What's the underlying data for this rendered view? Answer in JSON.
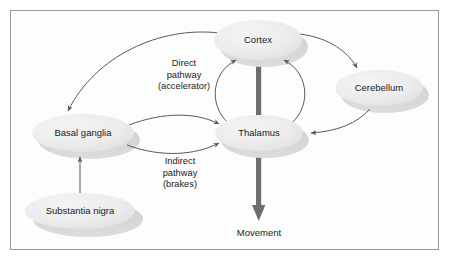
{
  "diagram": {
    "background_color": "#fdfdfd",
    "border_color": "#9a9a9a",
    "node_fill_color": "#ebebeb",
    "node_shadow_color": "#d2d2d2",
    "thin_arrow_color": "#5a5a5a",
    "thick_arrow_color": "#6e6e6e",
    "text_color": "#1c1c1c",
    "nodes": [
      {
        "id": "cortex",
        "label": "Cortex",
        "shape": "ellipse",
        "cx": 258,
        "cy": 40,
        "rx": 44,
        "ry": 20
      },
      {
        "id": "cerebellum",
        "label": "Cerebellum",
        "shape": "ellipse",
        "cx": 379,
        "cy": 88,
        "rx": 44,
        "ry": 18
      },
      {
        "id": "basal-ganglia",
        "label": "Basal ganglia",
        "shape": "ellipse",
        "cx": 83,
        "cy": 133,
        "rx": 51,
        "ry": 19
      },
      {
        "id": "thalamus",
        "label": "Thalamus",
        "shape": "ellipse",
        "cx": 259,
        "cy": 133,
        "rx": 44,
        "ry": 18
      },
      {
        "id": "substantia-nigra",
        "label": "Substantia nigra",
        "shape": "ellipse",
        "cx": 80,
        "cy": 211,
        "rx": 55,
        "ry": 18
      }
    ],
    "path_labels": [
      {
        "id": "direct-pathway",
        "lines": [
          "Direct",
          "pathway",
          "(accelerator)"
        ]
      },
      {
        "id": "indirect-pathway",
        "lines": [
          "Indirect",
          "pathway",
          "(brakes)"
        ]
      }
    ],
    "output_label": {
      "id": "movement",
      "text": "Movement"
    },
    "edges": [
      {
        "from": "cortex",
        "to": "basal-ganglia",
        "style": "curved-thin",
        "label": "direct-pathway"
      },
      {
        "from": "cortex",
        "to": "cerebellum",
        "style": "curved-thin"
      },
      {
        "from": "cerebellum",
        "to": "thalamus",
        "style": "curved-thin"
      },
      {
        "from": "basal-ganglia",
        "to": "thalamus",
        "style": "curved-thin",
        "label": "direct-pathway"
      },
      {
        "from": "basal-ganglia",
        "to": "thalamus",
        "style": "curved-thin",
        "label": "indirect-pathway"
      },
      {
        "from": "substantia-nigra",
        "to": "basal-ganglia",
        "style": "straight-thin"
      },
      {
        "from": "thalamus",
        "to": "cortex",
        "style": "curved-thin-left"
      },
      {
        "from": "thalamus",
        "to": "cortex",
        "style": "curved-thin-right"
      },
      {
        "from": "cortex",
        "to": "movement",
        "style": "thick-bar"
      }
    ]
  }
}
